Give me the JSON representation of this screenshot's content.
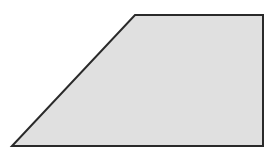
{
  "shape": {
    "type": "trapezoid",
    "fill": "#e0e0e0",
    "stroke": "#2a2a2a",
    "points": "135,15 263,15 263,146 12,146"
  }
}
